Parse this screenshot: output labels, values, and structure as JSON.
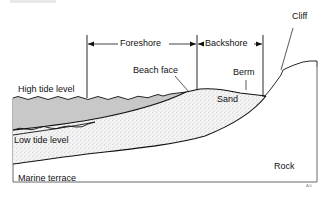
{
  "diagram": {
    "zones": {
      "foreshore": "Foreshore",
      "backshore": "Backshore"
    },
    "labels": {
      "cliff": "Cliff",
      "beach_face": "Beach face",
      "berm": "Berm",
      "high_tide_level": "High tide level",
      "sand": "Sand",
      "low_tide_level": "Low tide level",
      "marine_terrace": "Marine terrace",
      "rock": "Rock",
      "signature": "AG"
    },
    "colors": {
      "water": "#c8c8c8",
      "sand_fill": "#f2f2f2",
      "stipple": "#8a8a8a",
      "line": "#111111",
      "background": "#ffffff"
    }
  }
}
